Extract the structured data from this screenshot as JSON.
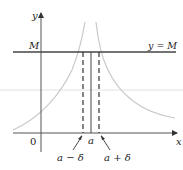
{
  "diagram": {
    "type": "infinite-limit-illustration",
    "axes": {
      "x_label": "x",
      "y_label": "y",
      "origin_label": "0"
    },
    "horizontal_line": {
      "left_label": "M",
      "right_label": "y = M"
    },
    "points": {
      "a_label": "a",
      "a_minus_delta_label": "a − δ",
      "a_plus_delta_label": "a + δ"
    },
    "colors": {
      "axis": "#555555",
      "m_line": "#444444",
      "curve": "#c8c8c8",
      "faint_line": "#dddddd",
      "dashed": "#333333",
      "text": "#222222"
    }
  }
}
